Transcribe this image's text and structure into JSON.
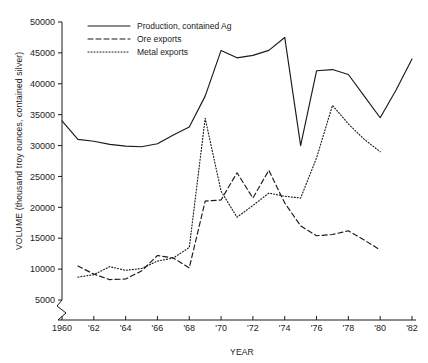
{
  "chart_data": {
    "type": "line",
    "title": "",
    "xlabel": "YEAR",
    "ylabel": "VOLUME (thousand troy ounces, contained silver)",
    "xlim": [
      1960,
      1982
    ],
    "ylim": [
      5000,
      50000
    ],
    "axis_break": "y-axis broken below 5000",
    "grid": false,
    "legend_position": "top-center",
    "x": [
      1960,
      1961,
      1962,
      1963,
      1964,
      1965,
      1966,
      1967,
      1968,
      1969,
      1970,
      1971,
      1972,
      1973,
      1974,
      1975,
      1976,
      1977,
      1978,
      1979,
      1980,
      1981,
      1982
    ],
    "xtick_values": [
      1960,
      1962,
      1964,
      1966,
      1968,
      1970,
      1972,
      1974,
      1976,
      1978,
      1980,
      1982
    ],
    "xtick_labels": [
      "1960",
      "'62",
      "'64",
      "'66",
      "'68",
      "'70",
      "'72",
      "'74",
      "'76",
      "'78",
      "'80",
      "'82"
    ],
    "ytick_values": [
      5000,
      10000,
      15000,
      20000,
      25000,
      30000,
      35000,
      40000,
      45000,
      50000
    ],
    "ytick_labels": [
      "5000",
      "10000",
      "15000",
      "20000",
      "25000",
      "30000",
      "35000",
      "40000",
      "45000",
      "50000"
    ],
    "series": [
      {
        "name": "Production, contained Ag",
        "style": "solid",
        "values": [
          34000,
          31000,
          30700,
          30200,
          29900,
          29800,
          30300,
          31700,
          33000,
          38000,
          45400,
          44200,
          44600,
          45400,
          47500,
          30000,
          42100,
          42300,
          41500,
          38000,
          34500,
          39000,
          44000
        ]
      },
      {
        "name": "Ore exports",
        "style": "dashed",
        "values": [
          null,
          10500,
          9200,
          8300,
          8400,
          9700,
          12200,
          11800,
          10200,
          21000,
          21200,
          25600,
          21500,
          26000,
          20700,
          17000,
          15400,
          15600,
          16200,
          14700,
          13100,
          null,
          null
        ]
      },
      {
        "name": "Metal exports",
        "style": "dotted",
        "values": [
          null,
          8700,
          9100,
          10400,
          9800,
          10100,
          11300,
          11800,
          13500,
          34400,
          22600,
          18400,
          20300,
          22300,
          21800,
          21500,
          28000,
          36500,
          33500,
          31000,
          29000,
          null,
          null
        ]
      }
    ]
  },
  "axes": {
    "ylabel": "VOLUME (thousand troy ounces, contained silver)",
    "xlabel": "YEAR"
  },
  "legend": {
    "items": [
      {
        "label": "Production, contained Ag",
        "style": "solid"
      },
      {
        "label": "Ore exports",
        "style": "dashed"
      },
      {
        "label": "Metal exports",
        "style": "dotted"
      }
    ]
  },
  "colors": {
    "ink": "#1a1a1a",
    "background": "#ffffff"
  }
}
